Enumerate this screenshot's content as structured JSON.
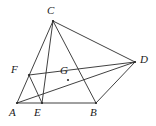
{
  "figure": {
    "width": 156,
    "height": 126,
    "background_color": "#ffffff",
    "stroke_color": "#2b2b2b",
    "stroke_width": 0.9,
    "label_color": "#1a1a1a"
  },
  "points": {
    "A": {
      "label": "A",
      "x": 17,
      "y": 103,
      "label_x": 9,
      "label_y": 107
    },
    "B": {
      "label": "B",
      "x": 96,
      "y": 103,
      "label_x": 90,
      "label_y": 107
    },
    "C": {
      "label": "C",
      "x": 53,
      "y": 21,
      "label_x": 47,
      "label_y": 5
    },
    "D": {
      "label": "D",
      "x": 135,
      "y": 62,
      "label_x": 140,
      "label_y": 54
    },
    "E": {
      "label": "E",
      "x": 42,
      "y": 103,
      "label_x": 34,
      "label_y": 107
    },
    "F": {
      "label": "F",
      "x": 29,
      "y": 75,
      "label_x": 11,
      "label_y": 64
    },
    "G": {
      "label": "G",
      "x": 68,
      "y": 80,
      "label_x": 60,
      "label_y": 65
    }
  },
  "segments": [
    {
      "name": "segment-A-B",
      "from": "A",
      "to": "B"
    },
    {
      "name": "segment-A-C",
      "from": "A",
      "to": "C"
    },
    {
      "name": "segment-A-D",
      "from": "A",
      "to": "D"
    },
    {
      "name": "segment-C-D",
      "from": "C",
      "to": "D"
    },
    {
      "name": "segment-C-B",
      "from": "C",
      "to": "B"
    },
    {
      "name": "segment-B-D",
      "from": "B",
      "to": "D"
    },
    {
      "name": "segment-F-E",
      "from": "F",
      "to": "E"
    },
    {
      "name": "segment-F-D",
      "from": "F",
      "to": "D"
    },
    {
      "name": "segment-E-C",
      "from": "E",
      "to": "C"
    }
  ],
  "vertex_order": [
    "A",
    "B",
    "C",
    "D",
    "E",
    "F",
    "G"
  ]
}
